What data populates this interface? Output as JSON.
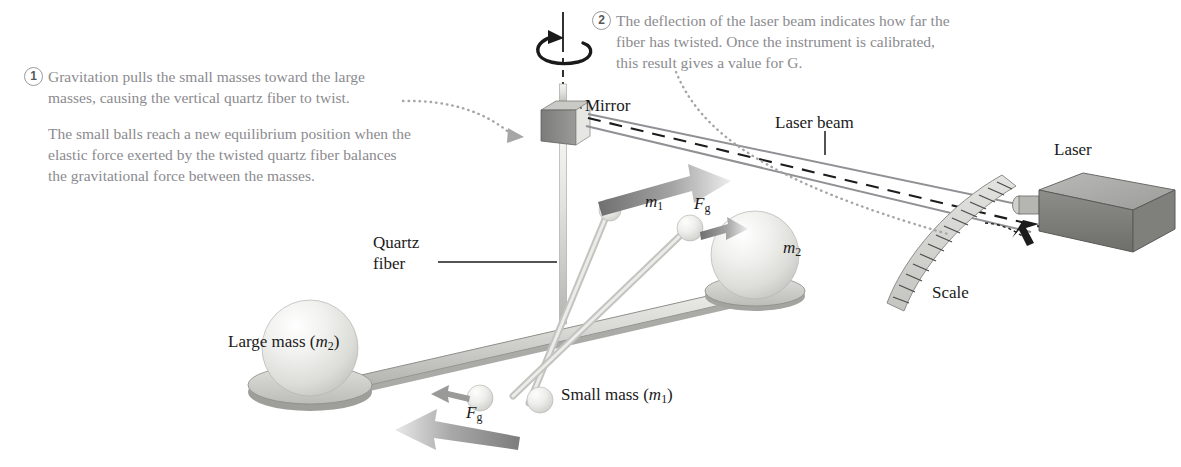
{
  "figure": {
    "colors": {
      "callout_text": "#8b8b8f",
      "label_text": "#1a1a1a",
      "beam_line": "#8e8e92",
      "dashed_line": "#1a1a1a",
      "metal_light": "#e8e8e6",
      "metal_mid": "#bdbdbb",
      "metal_dark": "#8a8a88",
      "sphere_light": "#f2f2f0",
      "arrow_grey": "#9a9a9a"
    }
  },
  "callouts": [
    {
      "number": "1",
      "text": "Gravitation pulls the small masses toward the large masses, causing the vertical quartz fiber to twist.",
      "text2": "The small balls reach a new equilibrium position when the elastic force exerted by the twisted quartz fiber balances the gravitational force between the masses."
    },
    {
      "number": "2",
      "text": "The deflection of the laser beam indicates how far the fiber has twisted. Once the instrument is calibrated, this result gives a value for G.",
      "text2": ""
    }
  ],
  "labels": {
    "mirror": "Mirror",
    "laser_beam": "Laser beam",
    "laser": "Laser",
    "scale": "Scale",
    "quartz_fiber_line1": "Quartz",
    "quartz_fiber_line2": "fiber",
    "large_mass": "Large mass (m₂)",
    "small_mass": "Small mass (m₁)",
    "m1": "m₁",
    "m2": "m₂",
    "fg_top": "Fg",
    "fg_bottom": "Fg",
    "force_symbol": "F",
    "force_subscript": "g"
  },
  "icons": {
    "rotation_arrow": "rotation-arrow-icon",
    "dotted_leader_1": "dotted-leader-icon",
    "dotted_leader_2": "dotted-leader-icon",
    "force_arrow_top": "force-arrow-icon",
    "force_arrow_bottom": "force-arrow-icon",
    "small_force_arrow": "small-force-arrow-icon"
  },
  "scale_ticks": {
    "count": 17,
    "description": "curved graduated scale strip"
  }
}
